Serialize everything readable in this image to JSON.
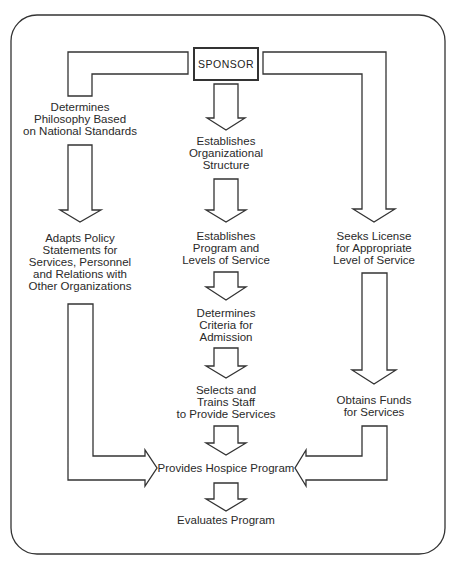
{
  "sponsor": {
    "label": "SPONSOR"
  },
  "nodes": {
    "philosophy": [
      "Determines",
      "Philosophy Based",
      "on National Standards"
    ],
    "org_structure": [
      "Establishes",
      "Organizational",
      "Structure"
    ],
    "policy": [
      "Adapts Policy",
      "Statements for",
      "Services, Personnel",
      "and Relations with",
      "Other Organizations"
    ],
    "program_levels": [
      "Establishes",
      "Program and",
      "Levels of Service"
    ],
    "license": [
      "Seeks License",
      "for Appropriate",
      "Level of Service"
    ],
    "admission": [
      "Determines",
      "Criteria for",
      "Admission"
    ],
    "staff": [
      "Selects and",
      "Trains Staff",
      "to Provide Services"
    ],
    "funds": [
      "Obtains Funds",
      "for Services"
    ],
    "hospice": [
      "Provides Hospice Program"
    ],
    "evaluate": [
      "Evaluates Program"
    ]
  },
  "colors": {
    "stroke": "#333333",
    "background": "#ffffff",
    "text": "#2a2a2a"
  }
}
